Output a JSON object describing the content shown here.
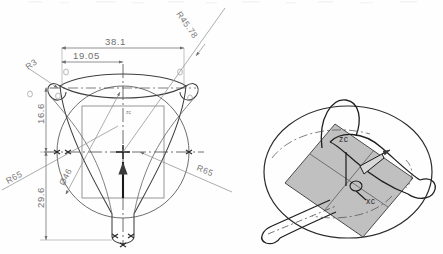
{
  "drawing": {
    "title": "Mechanical part — front view with dimensions and 3D isometric view",
    "background_color": "#fefefe",
    "line_color": "#6f6f6f",
    "solid_color": "#2b2b2b",
    "shaded_plane_color": "#b5b5b5"
  },
  "front_view": {
    "name": "front-view",
    "center_label": "zc",
    "dimensions": [
      {
        "id": "width-overall",
        "label": "38.1",
        "orientation": "horizontal",
        "position": "top"
      },
      {
        "id": "width-half",
        "label": "19.05",
        "orientation": "horizontal",
        "position": "top-inner"
      },
      {
        "id": "height-upper",
        "label": "16.6",
        "orientation": "vertical",
        "position": "left-upper"
      },
      {
        "id": "height-lower",
        "label": "29.6",
        "orientation": "vertical",
        "position": "left-lower"
      },
      {
        "id": "radius-fillet",
        "label": "R3",
        "orientation": "leader",
        "position": "top-left"
      },
      {
        "id": "radius-diagonal",
        "label": "R45.78",
        "orientation": "leader",
        "position": "top-right"
      },
      {
        "id": "radius-left",
        "label": "R65",
        "orientation": "leader",
        "position": "left"
      },
      {
        "id": "radius-right",
        "label": "R65",
        "orientation": "leader",
        "position": "right"
      },
      {
        "id": "diameter-circle",
        "label": "Ø46",
        "orientation": "leader",
        "position": "center-left"
      }
    ]
  },
  "iso_view": {
    "name": "iso-view",
    "labels": [
      {
        "id": "axis-z",
        "label": "zc"
      },
      {
        "id": "axis-x",
        "label": "xc"
      }
    ]
  }
}
